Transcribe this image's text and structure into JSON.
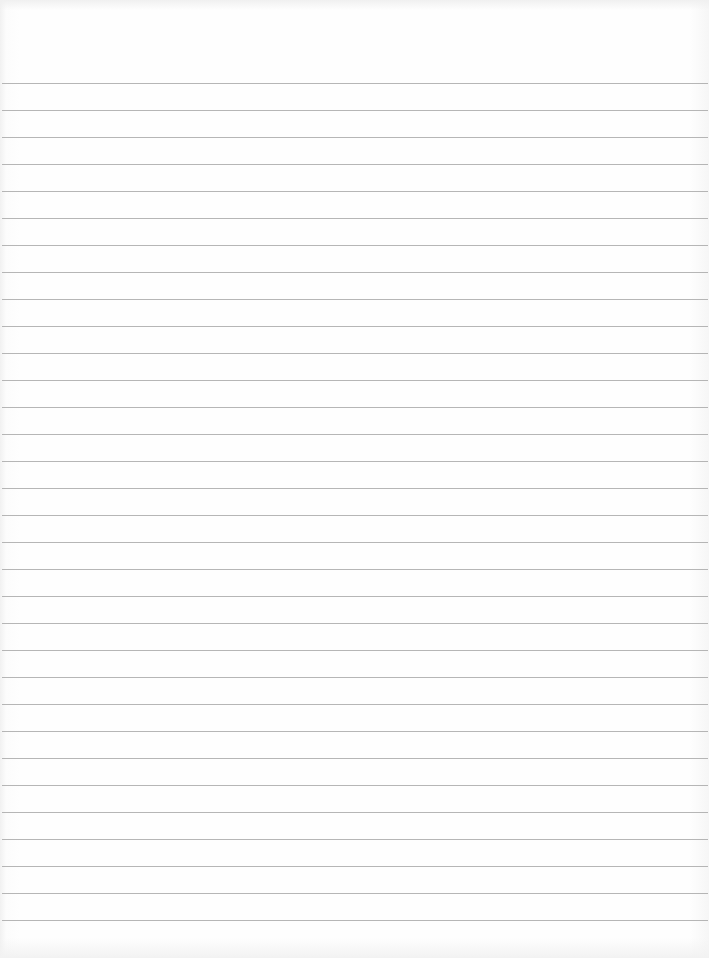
{
  "document": {
    "type": "lined-paper",
    "background_color": "#fdfdfd",
    "rule_color": "#a9a9a9",
    "rule_count": 32,
    "first_rule_y": 83,
    "rule_spacing": 27,
    "text_content": []
  }
}
